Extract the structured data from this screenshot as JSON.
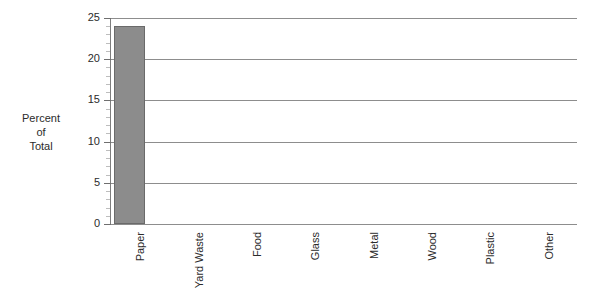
{
  "chart_data": {
    "type": "bar",
    "title": "",
    "xlabel": "",
    "ylabel": "Percent\nof\nTotal",
    "categories": [
      "Paper",
      "Yard Waste",
      "Food",
      "Glass",
      "Metal",
      "Wood",
      "Plastic",
      "Other"
    ],
    "values": [
      24,
      0,
      0,
      0,
      0,
      0,
      0,
      0
    ],
    "ylim": [
      0,
      25
    ],
    "y_ticks": [
      0,
      5,
      10,
      15,
      20,
      25
    ],
    "y_tick_labels": [
      "0",
      "5",
      "10",
      "15",
      "20",
      "25"
    ],
    "y_minor_tick_step": 1,
    "grid": "horizontal",
    "legend": "none",
    "bar_color": "#8c8c8c",
    "bar_edge_color": "#6a6a6a",
    "gridline_color": "#8d8d8d",
    "background_color": "#ffffff",
    "x_tick_label_rotation": 90
  }
}
